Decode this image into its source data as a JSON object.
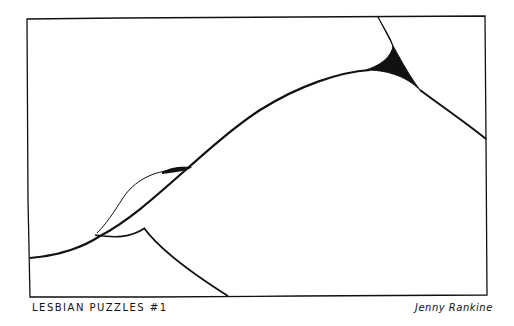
{
  "comic": {
    "title": "LESBIAN PUZZLES #1",
    "author": "Jenny Rankine"
  },
  "colors": {
    "ink": "#111111",
    "paper": "#ffffff"
  }
}
